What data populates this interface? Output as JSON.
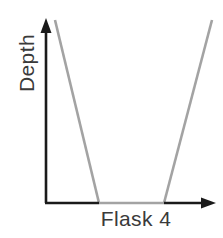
{
  "figure": {
    "background_color": "#ffffff"
  },
  "axes": {
    "y_label": "Depth",
    "x_label": "Flask 4",
    "axis_color": "#1a1a1a",
    "label_color": "#3a3a3a",
    "y_axis": {
      "x": 46,
      "y_top": 20,
      "y_bottom": 203,
      "arrow": "up-arrow"
    },
    "x_axis": {
      "y": 203,
      "x_left": 46,
      "x_right": 215,
      "arrow": "right-arrow"
    }
  },
  "chart_data": {
    "type": "line",
    "title": "Flask 4",
    "xlabel": "Flask 4",
    "ylabel": "Depth",
    "grid": false,
    "legend": null,
    "annotations": [],
    "shape_color": "#a3a3a3",
    "shape_line_width": 2.6,
    "series": [
      {
        "name": "left-wall",
        "points": [
          [
            55,
            20
          ],
          [
            99,
            203
          ]
        ]
      },
      {
        "name": "flask-bottom",
        "points": [
          [
            99,
            203
          ],
          [
            164,
            203
          ]
        ]
      },
      {
        "name": "right-wall",
        "points": [
          [
            164,
            203
          ],
          [
            212,
            20
          ]
        ]
      }
    ],
    "xlim": [
      46,
      215
    ],
    "ylim": [
      203,
      20
    ]
  }
}
